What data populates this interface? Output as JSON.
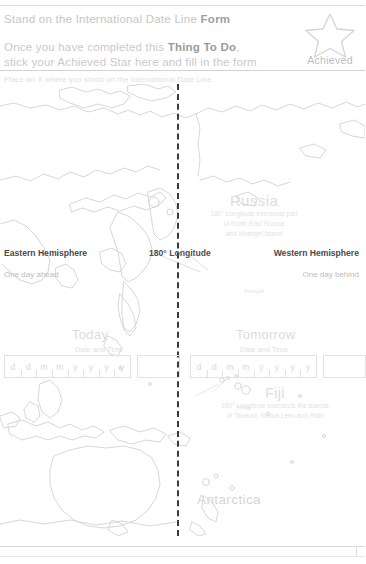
{
  "header": {
    "title_plain": "Stand on the International Date Line ",
    "title_bold": "Form",
    "instruction_line1_a": "Once you have completed this ",
    "instruction_line1_b": "Thing To Do",
    "instruction_line1_c": ",",
    "instruction_line2": "stick your Achieved Star here and fill in the form",
    "badge_label": "Achieved",
    "badge_icon": "star-icon"
  },
  "sub_instruction": "Place an X where you stood on the International Date Line",
  "hemispheres": {
    "east_label": "Eastern Hemisphere",
    "east_note": "One day ahead",
    "center_label": "180° Longitude",
    "west_label": "Western Hemisphere",
    "west_note": "One day behind"
  },
  "columns": {
    "today": {
      "title": "Today",
      "subtitle": "Date and Time"
    },
    "tomorrow": {
      "title": "Tomorrow",
      "subtitle": "Date and Time"
    }
  },
  "date_field": {
    "cells": [
      "d",
      "d",
      "m",
      "m",
      "y",
      "y",
      "y",
      "y"
    ],
    "time_value": ""
  },
  "annotations": {
    "russia": {
      "name": "Russia",
      "desc_line1": "180° Longitude intersects part",
      "desc_line2": "of North East Russia",
      "desc_line3": "and Wrangel Island"
    },
    "fiji": {
      "name": "Fiji",
      "desc_line1": "180° Longitude intersects the islands",
      "desc_line2": "of Taveuni, Vanua Levu and Rabi"
    },
    "antarctica": {
      "name": "Antarctica"
    },
    "island_wrangel": "Wrangel",
    "island_tonga": "Tonga"
  },
  "colors": {
    "dateline": "#3a3a3a",
    "coastline": "#d7d7d7",
    "text_faint": "#dcdcdc",
    "text_label": "#4a4a4a",
    "rule": "#d9d9d9"
  }
}
